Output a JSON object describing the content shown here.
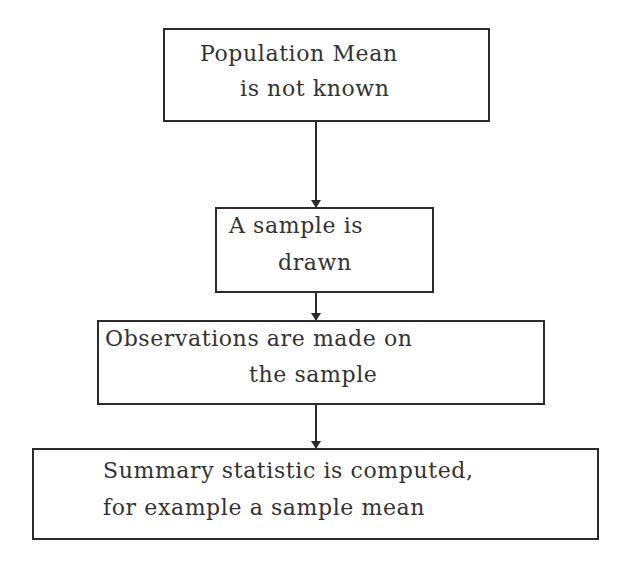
{
  "flowchart": {
    "nodes": [
      {
        "id": "population-mean",
        "lines": [
          "Population Mean",
          "is not known"
        ]
      },
      {
        "id": "sample-drawn",
        "lines": [
          "A sample is",
          "drawn"
        ]
      },
      {
        "id": "observations",
        "lines": [
          "Observations are made on",
          "the sample"
        ]
      },
      {
        "id": "summary-statistic",
        "lines": [
          "Summary statistic is computed,",
          "for example a sample mean"
        ]
      }
    ],
    "edges": [
      {
        "from": "population-mean",
        "to": "sample-drawn"
      },
      {
        "from": "sample-drawn",
        "to": "observations"
      },
      {
        "from": "observations",
        "to": "summary-statistic"
      }
    ]
  }
}
